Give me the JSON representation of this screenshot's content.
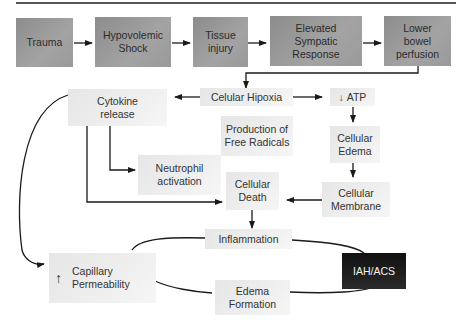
{
  "diagram": {
    "title": "",
    "top_row": [
      {
        "id": "trauma",
        "label": "Trauma"
      },
      {
        "id": "hypovolemic_shock",
        "label": "Hypovolemic\nShock"
      },
      {
        "id": "tissue_injury",
        "label": "Tissue\ninjury"
      },
      {
        "id": "elevated_sympatic_response",
        "label": "Elevated\nSympatic\nResponse"
      },
      {
        "id": "lower_bowel_perfusion",
        "label": "Lower\nbowel\nperfusion"
      }
    ],
    "nodes": {
      "cellular_hipoxia": "Celular Hipoxia",
      "atp": "ATP",
      "atp_prefix_icon": "down-arrow",
      "cytokine_release": "Cytokine\nrelease",
      "free_radicals": "Production of\nFree Radicals",
      "cellular_edema": "Cellular\nEdema",
      "neutrophil_activation": "Neutrophil\nactivation",
      "cellular_death": "Cellular\nDeath",
      "cellular_membrane": "Cellular\nMembrane",
      "inflammation": "Inflammation",
      "capillary_permeability": "Capillary\nPermeability",
      "capillary_prefix_icon": "up-arrow",
      "iah_acs": "IAH/ACS",
      "edema_formation": "Edema\nFormation"
    },
    "edges": [
      [
        "Trauma",
        "Hypovolemic Shock"
      ],
      [
        "Hypovolemic Shock",
        "Tissue injury"
      ],
      [
        "Tissue injury",
        "Elevated Sympatic Response"
      ],
      [
        "Elevated Sympatic Response",
        "Lower bowel perfusion"
      ],
      [
        "Lower bowel perfusion",
        "Celular Hipoxia"
      ],
      [
        "Celular Hipoxia",
        "Cytokine release"
      ],
      [
        "Celular Hipoxia",
        "ATP"
      ],
      [
        "ATP",
        "Cellular Edema"
      ],
      [
        "Cellular Edema",
        "Cellular Membrane"
      ],
      [
        "Cellular Membrane",
        "Cellular Death"
      ],
      [
        "Cytokine release",
        "Neutrophil activation"
      ],
      [
        "Cytokine release",
        "Cellular Death"
      ],
      [
        "Cytokine release",
        "Capillary Permeability"
      ],
      [
        "Cellular Death",
        "Inflammation"
      ],
      [
        "Inflammation",
        "IAH/ACS"
      ],
      [
        "Capillary Permeability",
        "IAH/ACS"
      ],
      [
        "Edema Formation",
        "IAH/ACS"
      ]
    ],
    "colors": {
      "top_row_fill": "#9a9a9a",
      "node_fill": "#ececec",
      "iah_fill": "#1c1c1c",
      "line": "#1a1a1a"
    }
  }
}
